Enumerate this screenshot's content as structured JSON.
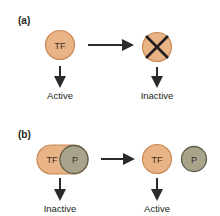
{
  "panels": [
    {
      "label": "(a)",
      "left_node": {
        "text": "TF",
        "state": "Active"
      },
      "right_node": {
        "text": "",
        "state": "Inactive",
        "marker": "x-mark"
      }
    },
    {
      "label": "(b)",
      "left_node": {
        "text_tf": "TF",
        "text_p": "P",
        "state": "Inactive"
      },
      "right_node": {
        "text_tf": "TF",
        "text_p": "P",
        "state": "Active"
      }
    }
  ],
  "colors": {
    "tf_fill": "#e8b385",
    "tf_stroke": "#c98a55",
    "p_fill": "#a8a48c",
    "p_stroke": "#5f5c4a",
    "arrow": "#2b2b2b"
  }
}
